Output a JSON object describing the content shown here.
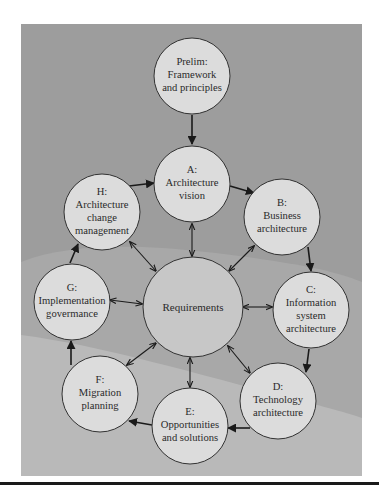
{
  "diagram": {
    "title": "",
    "colors": {
      "panel_dark": "#9b9b9b",
      "panel_mid": "#a9a9a9",
      "panel_light": "#bcbcbc",
      "node_fill": "#dcdcdc",
      "center_fill": "#c6c6c6",
      "stroke": "#333333"
    },
    "nodes": {
      "prelim": {
        "lines": [
          "Prelim:",
          "Framework",
          "and principles"
        ]
      },
      "a": {
        "lines": [
          "A:",
          "Architecture",
          "vision"
        ]
      },
      "b": {
        "lines": [
          "B:",
          "Business",
          "architecture"
        ]
      },
      "c": {
        "lines": [
          "C:",
          "Information",
          "system",
          "architecture"
        ]
      },
      "d": {
        "lines": [
          "D:",
          "Technology",
          "architecture"
        ]
      },
      "e": {
        "lines": [
          "E:",
          "Opportunities",
          "and solutions"
        ]
      },
      "f": {
        "lines": [
          "F:",
          "Migration",
          "planning"
        ]
      },
      "g": {
        "lines": [
          "G:",
          "Implementation",
          "govermance"
        ]
      },
      "h": {
        "lines": [
          "H:",
          "Architecture",
          "change",
          "management"
        ]
      },
      "center": {
        "lines": [
          "Requirements"
        ]
      }
    },
    "edges": [
      {
        "from": "Prelim",
        "to": "A",
        "type": "directed"
      },
      {
        "from": "A",
        "to": "B",
        "type": "directed"
      },
      {
        "from": "B",
        "to": "C",
        "type": "directed"
      },
      {
        "from": "C",
        "to": "D",
        "type": "directed"
      },
      {
        "from": "D",
        "to": "E",
        "type": "directed"
      },
      {
        "from": "E",
        "to": "F",
        "type": "directed"
      },
      {
        "from": "F",
        "to": "G",
        "type": "directed"
      },
      {
        "from": "G",
        "to": "H",
        "type": "directed"
      },
      {
        "from": "H",
        "to": "A",
        "type": "directed"
      },
      {
        "from": "Requirements",
        "to": "A",
        "type": "bidirectional"
      },
      {
        "from": "Requirements",
        "to": "B",
        "type": "bidirectional"
      },
      {
        "from": "Requirements",
        "to": "C",
        "type": "bidirectional"
      },
      {
        "from": "Requirements",
        "to": "D",
        "type": "bidirectional"
      },
      {
        "from": "Requirements",
        "to": "E",
        "type": "bidirectional"
      },
      {
        "from": "Requirements",
        "to": "F",
        "type": "bidirectional"
      },
      {
        "from": "Requirements",
        "to": "G",
        "type": "bidirectional"
      },
      {
        "from": "Requirements",
        "to": "H",
        "type": "bidirectional"
      }
    ]
  }
}
